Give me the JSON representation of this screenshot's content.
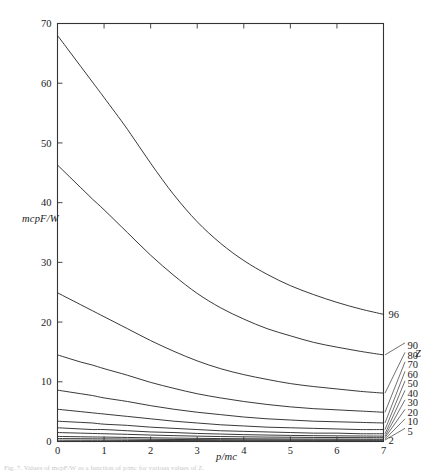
{
  "figure": {
    "ylabel": "mcpF/W",
    "xlabel": "p/mc",
    "zlabel": "Z",
    "caption": "Fig. 7. Values of mcpF/W as a function of p/mc for various values of Z."
  },
  "chart_data": {
    "type": "line",
    "title": "",
    "xlabel": "p/mc",
    "ylabel": "mcpF/W",
    "zlabel": "Z",
    "xlim": [
      0,
      7
    ],
    "ylim": [
      0,
      70
    ],
    "xticks": [
      0,
      1,
      2,
      3,
      4,
      5,
      6,
      7
    ],
    "xticklabels": [
      "0",
      "1",
      "2",
      "3",
      "4",
      "5",
      "6",
      "7"
    ],
    "yticks": [
      0,
      10,
      20,
      30,
      40,
      50,
      60,
      70
    ],
    "yticklabels": [
      "0",
      "10",
      "20",
      "30",
      "40",
      "50",
      "60",
      "70"
    ],
    "grid": false,
    "legend_position": "right-edge-labels",
    "x": [
      0,
      0.25,
      0.5,
      0.75,
      1,
      1.5,
      2,
      2.5,
      3,
      3.5,
      4,
      4.5,
      5,
      5.5,
      6,
      6.5,
      7
    ],
    "series": [
      {
        "name": "96",
        "label": "96",
        "values": [
          68.0,
          65.4,
          62.8,
          60.2,
          57.6,
          52.3,
          46.6,
          41.3,
          36.8,
          33.2,
          30.3,
          28.0,
          26.1,
          24.6,
          23.3,
          22.2,
          21.3
        ]
      },
      {
        "name": "90",
        "label": "90",
        "values": [
          46.3,
          44.4,
          42.5,
          40.6,
          38.8,
          35.0,
          31.2,
          27.8,
          24.8,
          22.4,
          20.5,
          18.9,
          17.7,
          16.6,
          15.8,
          15.1,
          14.5
        ]
      },
      {
        "name": "80",
        "label": "80",
        "values": [
          24.9,
          23.9,
          22.9,
          21.9,
          20.9,
          18.9,
          16.9,
          15.1,
          13.5,
          12.2,
          11.2,
          10.4,
          9.7,
          9.2,
          8.8,
          8.4,
          8.1
        ]
      },
      {
        "name": "70",
        "label": "70",
        "values": [
          14.5,
          13.9,
          13.3,
          12.8,
          12.2,
          11.1,
          9.9,
          8.9,
          8.0,
          7.3,
          6.7,
          6.2,
          5.8,
          5.5,
          5.3,
          5.1,
          4.9
        ]
      },
      {
        "name": "60",
        "label": "60",
        "values": [
          8.6,
          8.3,
          8.0,
          7.7,
          7.3,
          6.7,
          6.0,
          5.4,
          4.9,
          4.5,
          4.1,
          3.8,
          3.6,
          3.4,
          3.3,
          3.2,
          3.1
        ]
      },
      {
        "name": "50",
        "label": "50",
        "values": [
          5.4,
          5.2,
          5.0,
          4.8,
          4.6,
          4.2,
          3.8,
          3.4,
          3.1,
          2.8,
          2.6,
          2.4,
          2.3,
          2.2,
          2.1,
          2.0,
          2.0
        ]
      },
      {
        "name": "40",
        "label": "40",
        "values": [
          3.4,
          3.3,
          3.2,
          3.1,
          2.9,
          2.7,
          2.4,
          2.2,
          2.0,
          1.8,
          1.7,
          1.6,
          1.5,
          1.4,
          1.4,
          1.3,
          1.3
        ]
      },
      {
        "name": "30",
        "label": "30",
        "values": [
          2.3,
          2.2,
          2.1,
          2.0,
          2.0,
          1.8,
          1.6,
          1.5,
          1.35,
          1.25,
          1.15,
          1.08,
          1.02,
          0.98,
          0.95,
          0.92,
          0.9
        ]
      },
      {
        "name": "20",
        "label": "20",
        "values": [
          1.5,
          1.45,
          1.4,
          1.35,
          1.3,
          1.2,
          1.08,
          0.98,
          0.9,
          0.83,
          0.78,
          0.74,
          0.71,
          0.68,
          0.66,
          0.65,
          0.64
        ]
      },
      {
        "name": "10",
        "label": "10",
        "values": [
          0.85,
          0.82,
          0.79,
          0.76,
          0.74,
          0.68,
          0.62,
          0.57,
          0.53,
          0.49,
          0.46,
          0.44,
          0.42,
          0.41,
          0.4,
          0.39,
          0.38
        ]
      },
      {
        "name": "5",
        "label": "5",
        "values": [
          0.5,
          0.48,
          0.47,
          0.45,
          0.44,
          0.41,
          0.37,
          0.34,
          0.32,
          0.3,
          0.28,
          0.27,
          0.26,
          0.25,
          0.25,
          0.24,
          0.24
        ]
      },
      {
        "name": "2",
        "label": "2",
        "values": [
          0.22,
          0.21,
          0.21,
          0.2,
          0.2,
          0.18,
          0.17,
          0.16,
          0.15,
          0.14,
          0.13,
          0.13,
          0.12,
          0.12,
          0.12,
          0.11,
          0.11
        ]
      }
    ],
    "edge_labels": [
      {
        "text": "96",
        "value": 21.3
      },
      {
        "text": "90",
        "value": 14.5
      },
      {
        "text": "80",
        "value": 8.1
      },
      {
        "text": "70",
        "value": 4.9
      },
      {
        "text": "60",
        "value": 3.1
      },
      {
        "text": "50",
        "value": 2.0
      },
      {
        "text": "40",
        "value": 1.3
      },
      {
        "text": "30",
        "value": 0.9
      },
      {
        "text": "20",
        "value": 0.64
      },
      {
        "text": "10",
        "value": 0.38
      },
      {
        "text": "5",
        "value": 0.24
      },
      {
        "text": "2",
        "value": 0.11
      }
    ]
  }
}
